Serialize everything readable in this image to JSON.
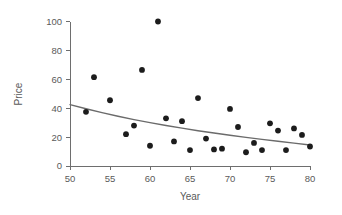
{
  "chart_data": {
    "type": "scatter",
    "title": "",
    "xlabel": "Year",
    "ylabel": "Price",
    "xlim": [
      50,
      80
    ],
    "ylim": [
      0,
      100
    ],
    "xticks": [
      50,
      55,
      60,
      65,
      70,
      75,
      80
    ],
    "yticks": [
      0,
      20,
      40,
      60,
      80,
      100
    ],
    "xtick_labels": [
      "50",
      "55",
      "60",
      "65",
      "70",
      "75",
      "80"
    ],
    "ytick_labels": [
      "0",
      "20",
      "40",
      "60",
      "80",
      "100"
    ],
    "grid": false,
    "legend": null,
    "marker_color": "#1c1c1c",
    "trend_color": "#6b6b6b",
    "axis_color": "#6e6e6e",
    "points": [
      {
        "x": 52,
        "y": 37.5
      },
      {
        "x": 53,
        "y": 61.5
      },
      {
        "x": 55,
        "y": 45.5
      },
      {
        "x": 57,
        "y": 22.0
      },
      {
        "x": 58,
        "y": 28.0
      },
      {
        "x": 59,
        "y": 66.5
      },
      {
        "x": 60,
        "y": 14.0
      },
      {
        "x": 61,
        "y": 100.0
      },
      {
        "x": 62,
        "y": 33.0
      },
      {
        "x": 63,
        "y": 17.0
      },
      {
        "x": 64,
        "y": 31.0
      },
      {
        "x": 65,
        "y": 11.0
      },
      {
        "x": 66,
        "y": 47.0
      },
      {
        "x": 67,
        "y": 19.0
      },
      {
        "x": 68,
        "y": 11.5
      },
      {
        "x": 69,
        "y": 12.0
      },
      {
        "x": 70,
        "y": 39.5
      },
      {
        "x": 71,
        "y": 27.0
      },
      {
        "x": 72,
        "y": 9.5
      },
      {
        "x": 73,
        "y": 16.0
      },
      {
        "x": 74,
        "y": 11.0
      },
      {
        "x": 75,
        "y": 29.5
      },
      {
        "x": 76,
        "y": 24.5
      },
      {
        "x": 77,
        "y": 11.0
      },
      {
        "x": 78,
        "y": 26.0
      },
      {
        "x": 79,
        "y": 21.5
      },
      {
        "x": 80,
        "y": 13.5
      }
    ],
    "trend": {
      "name": "fitted-curve",
      "points": [
        {
          "x": 50,
          "y": 42.5
        },
        {
          "x": 52,
          "y": 39.6
        },
        {
          "x": 54,
          "y": 36.9
        },
        {
          "x": 56,
          "y": 34.4
        },
        {
          "x": 58,
          "y": 32.1
        },
        {
          "x": 60,
          "y": 30.0
        },
        {
          "x": 62,
          "y": 28.0
        },
        {
          "x": 64,
          "y": 26.2
        },
        {
          "x": 66,
          "y": 24.4
        },
        {
          "x": 68,
          "y": 22.8
        },
        {
          "x": 70,
          "y": 21.3
        },
        {
          "x": 72,
          "y": 19.8
        },
        {
          "x": 74,
          "y": 18.4
        },
        {
          "x": 76,
          "y": 17.1
        },
        {
          "x": 78,
          "y": 15.8
        },
        {
          "x": 80,
          "y": 14.5
        }
      ]
    }
  }
}
